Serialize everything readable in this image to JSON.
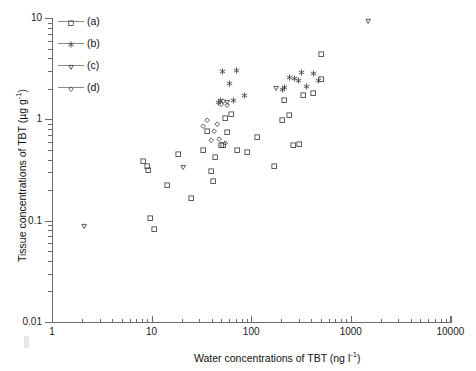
{
  "chart_data": {
    "type": "scatter",
    "title": "",
    "xlabel": "Water concentrations of TBT (ng l-1)",
    "ylabel": "Tissue concentrations of TBT (µg g-1)",
    "xscale": "log",
    "yscale": "log",
    "xlim": [
      1,
      10000
    ],
    "ylim": [
      0.01,
      10
    ],
    "grid": false,
    "xticks": [
      "1",
      "10",
      "100",
      "1000",
      "10000"
    ],
    "yticks": [
      "0.01",
      "0.1",
      "1",
      "10"
    ],
    "legend_position": "upper-left",
    "series": [
      {
        "name": "(a)",
        "marker": "square",
        "points": [
          [
            8.3,
            0.39
          ],
          [
            9.0,
            0.345
          ],
          [
            9.2,
            0.315
          ],
          [
            9.6,
            0.105
          ],
          [
            10.6,
            0.083
          ],
          [
            14.5,
            0.225
          ],
          [
            18.5,
            0.455
          ],
          [
            25.0,
            0.165
          ],
          [
            33.0,
            0.5
          ],
          [
            36.0,
            0.755
          ],
          [
            40.0,
            0.305
          ],
          [
            42.0,
            0.245
          ],
          [
            44.0,
            0.425
          ],
          [
            50.0,
            0.55
          ],
          [
            52.0,
            0.55
          ],
          [
            55.0,
            1.02
          ],
          [
            58.0,
            0.74
          ],
          [
            63.0,
            1.13
          ],
          [
            72.0,
            0.5
          ],
          [
            92.0,
            0.47
          ],
          [
            115.0,
            0.67
          ],
          [
            170.0,
            0.345
          ],
          [
            205.0,
            0.99
          ],
          [
            215.0,
            1.55
          ],
          [
            240.0,
            1.1
          ],
          [
            265.0,
            0.55
          ],
          [
            300.0,
            0.57
          ],
          [
            330.0,
            1.72
          ],
          [
            420.0,
            1.8
          ],
          [
            505.0,
            2.5
          ],
          [
            510.0,
            4.35
          ]
        ]
      },
      {
        "name": "(b)",
        "marker": "asterisk",
        "points": [
          [
            47.0,
            1.45
          ],
          [
            49.0,
            1.55
          ],
          [
            52.0,
            2.95
          ],
          [
            60.0,
            2.25
          ],
          [
            66.0,
            1.52
          ],
          [
            72.0,
            3.05
          ],
          [
            85.0,
            1.7
          ],
          [
            205.0,
            1.95
          ],
          [
            215.0,
            2.05
          ],
          [
            245.0,
            2.6
          ],
          [
            270.0,
            2.55
          ],
          [
            300.0,
            2.4
          ],
          [
            320.0,
            2.9
          ],
          [
            360.0,
            2.1
          ],
          [
            425.0,
            2.85
          ],
          [
            470.0,
            2.4
          ]
        ]
      },
      {
        "name": "(c)",
        "marker": "triangle-down",
        "points": [
          [
            2.1,
            0.088
          ],
          [
            21.0,
            0.335
          ],
          [
            57.0,
            1.48
          ],
          [
            180.0,
            2.05
          ],
          [
            1500.0,
            9.2
          ]
        ]
      },
      {
        "name": "(d)",
        "marker": "diamond",
        "points": [
          [
            33.0,
            0.86
          ],
          [
            36.0,
            0.99
          ],
          [
            40.0,
            0.62
          ],
          [
            43.0,
            0.77
          ],
          [
            46.0,
            0.9
          ],
          [
            48.0,
            0.64
          ],
          [
            50.0,
            1.42
          ],
          [
            52.0,
            1.5
          ],
          [
            55.0,
            0.58
          ],
          [
            58.0,
            1.38
          ]
        ]
      }
    ]
  },
  "legend": {
    "items": [
      {
        "label": "(a)",
        "marker": "square"
      },
      {
        "label": "(b)",
        "marker": "asterisk"
      },
      {
        "label": "(c)",
        "marker": "triangle-down"
      },
      {
        "label": "(d)",
        "marker": "diamond"
      }
    ]
  },
  "axis": {
    "x_title_main": "Water concentrations of TBT (ng l",
    "x_title_sup": "-1",
    "x_title_tail": ")",
    "y_title_main": "Tissue concentrations of TBT (µg g",
    "y_title_sup": "-1",
    "y_title_tail": ")"
  },
  "style": {
    "marker_color": "#4a4a4a",
    "axis_color": "#6b6b6b",
    "text_color": "#111111",
    "background": "#ffffff"
  }
}
